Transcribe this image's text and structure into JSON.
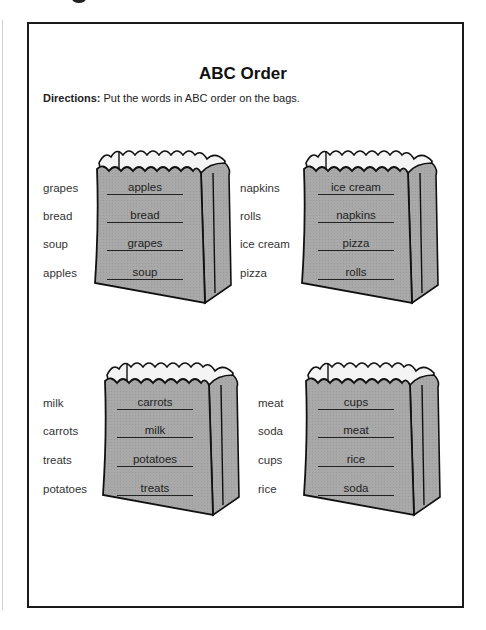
{
  "worksheet": {
    "title": "ABC Order",
    "directions_label": "Directions:",
    "directions_text": " Put the words in ABC order on the bags.",
    "bag_fill": "#a9a9a9",
    "bags": [
      {
        "words": [
          "grapes",
          "bread",
          "soup",
          "apples"
        ],
        "answers": [
          "apples",
          "bread",
          "grapes",
          "soup"
        ]
      },
      {
        "words": [
          "napkins",
          "rolls",
          "ice cream",
          "pizza"
        ],
        "answers": [
          "ice cream",
          "napkins",
          "pizza",
          "rolls"
        ]
      },
      {
        "words": [
          "milk",
          "carrots",
          "treats",
          "potatoes"
        ],
        "answers": [
          "carrots",
          "milk",
          "potatoes",
          "treats"
        ]
      },
      {
        "words": [
          "meat",
          "soda",
          "cups",
          "rice"
        ],
        "answers": [
          "cups",
          "meat",
          "rice",
          "soda"
        ]
      }
    ]
  }
}
